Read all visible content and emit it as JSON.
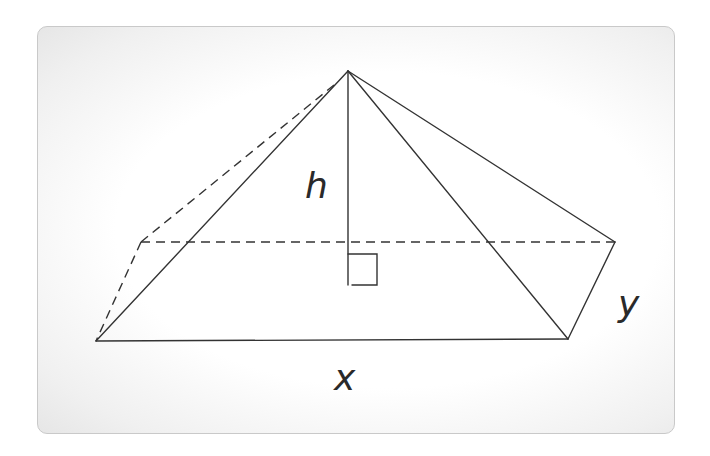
{
  "diagram": {
    "type": "rectangular pyramid",
    "labels": {
      "height": "h",
      "base_length": "x",
      "base_width": "y"
    },
    "vertices": {
      "apex": [
        348,
        71
      ],
      "front_left": [
        96,
        341
      ],
      "front_right": [
        568,
        339
      ],
      "back_right": [
        615,
        242
      ],
      "back_left": [
        141,
        242
      ]
    },
    "colors": {
      "stroke": "#333333",
      "label": "#2a2a2a",
      "card_border": "#c9c9c9"
    }
  }
}
